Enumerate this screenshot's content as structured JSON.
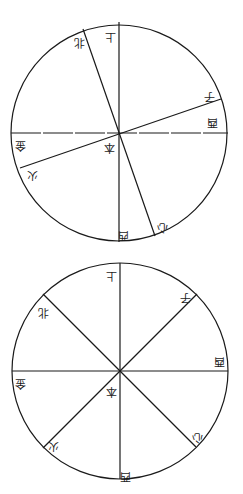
{
  "diagrams": [
    {
      "id": "upper-circle",
      "center": [
        119,
        133
      ],
      "radius": 108,
      "line_angles_deg": [
        90,
        110,
        160,
        180
      ],
      "labels": [
        {
          "text": "上",
          "x": 110,
          "y": 36
        },
        {
          "text": "北",
          "x": 79,
          "y": 42
        },
        {
          "text": "子",
          "x": 209,
          "y": 96
        },
        {
          "text": "酉",
          "x": 212,
          "y": 122
        },
        {
          "text": "本",
          "x": 109,
          "y": 147
        },
        {
          "text": "金",
          "x": 20,
          "y": 145
        },
        {
          "text": "火",
          "x": 32,
          "y": 175
        },
        {
          "text": "西",
          "x": 123,
          "y": 235
        },
        {
          "text": "心",
          "x": 162,
          "y": 227
        }
      ]
    },
    {
      "id": "lower-circle",
      "center": [
        120,
        371
      ],
      "radius": 108,
      "line_angles_deg": [
        90,
        135,
        180,
        225
      ],
      "labels": [
        {
          "text": "上",
          "x": 111,
          "y": 275
        },
        {
          "text": "子",
          "x": 185,
          "y": 297
        },
        {
          "text": "北",
          "x": 43,
          "y": 312
        },
        {
          "text": "酉",
          "x": 219,
          "y": 361
        },
        {
          "text": "金",
          "x": 20,
          "y": 383
        },
        {
          "text": "本",
          "x": 111,
          "y": 391
        },
        {
          "text": "心",
          "x": 197,
          "y": 437
        },
        {
          "text": "火",
          "x": 53,
          "y": 446
        },
        {
          "text": "西",
          "x": 125,
          "y": 476
        }
      ]
    }
  ],
  "colors": {
    "ink": "#1a1a1a",
    "paper": "#ffffff"
  }
}
